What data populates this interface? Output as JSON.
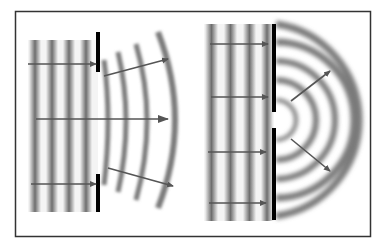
{
  "figure": {
    "colors": {
      "background": "#ffffff",
      "frame": "#333333",
      "wave_dark": "#6e6e6e",
      "wave_light": "#f2f2f2",
      "barrier": "#000000",
      "arrow": "#555555"
    },
    "panels": [
      {
        "id": "wide-gap",
        "incident_wavefronts": 4,
        "diffracted_wavefronts": 4,
        "incident_arrows": 3,
        "diffracted_arrows": 3
      },
      {
        "id": "narrow-gap",
        "incident_wavefronts": 4,
        "diffracted_wavefronts": 4,
        "incident_arrows": 4,
        "diffracted_arrows": 2
      }
    ]
  }
}
